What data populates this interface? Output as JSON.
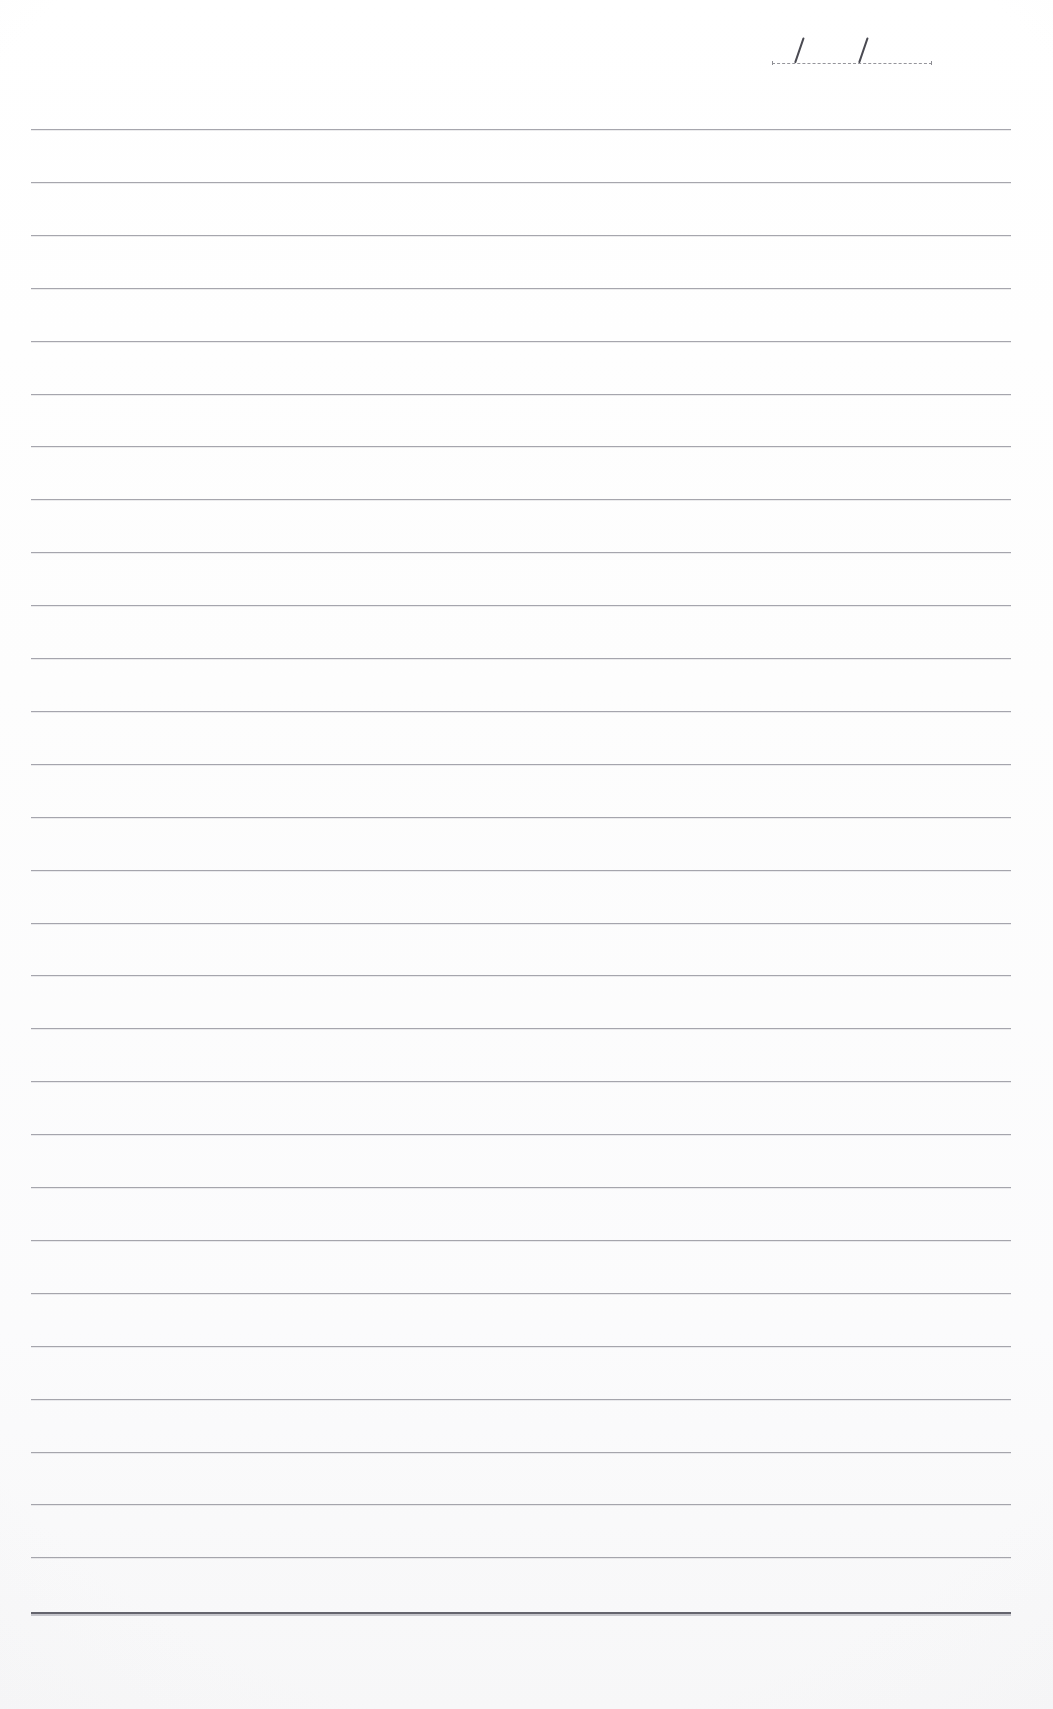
{
  "page": {
    "kind": "ruled-notebook-page",
    "width": 1053,
    "height": 1709,
    "paper_color": "#fdfdfd",
    "rule_color": "#9a9aa2",
    "heavy_rule_color": "#5d5d66",
    "ink_color": "#4a4a52",
    "body_text": ""
  },
  "date_line": {
    "label": "",
    "value": "",
    "placeholder": "",
    "separator": "/",
    "separator_count": 2,
    "format": "DD / MM / YY",
    "rule_style": "dashed",
    "rule_left": 772,
    "rule_top": 58,
    "rule_width": 160,
    "slash_positions": [
      22,
      86
    ]
  },
  "rules": {
    "count": 28,
    "first_y": 129,
    "spacing": 52.9,
    "left": 31,
    "right": 1011,
    "width": 980,
    "heavy_rule_y": 1612,
    "heavy_rule_weight": 2
  },
  "content": {
    "lines_written": 0,
    "is_blank": true,
    "written_text": []
  }
}
